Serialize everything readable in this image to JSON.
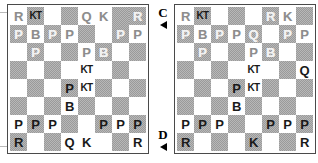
{
  "page": {
    "background_color": "#ffffff"
  },
  "colors": {
    "light_square": "#ffffff",
    "dark_square": "#9a9a9a",
    "board_border": "#4a4a4a",
    "black_piece": "#1a1a1a",
    "white_piece": "#e8e8e8",
    "marker_text": "#000000"
  },
  "markers": [
    {
      "id": "marker-c",
      "label": "C",
      "arrow": "left-triangle-icon",
      "points_to": "diagram-right-top"
    },
    {
      "id": "marker-d",
      "label": "D",
      "arrow": "right-triangle-icon",
      "points_to": "diagram-right-bottom"
    }
  ],
  "piece_glyphs": {
    "R": "R",
    "KT": "KT",
    "B": "B",
    "Q": "Q",
    "K": "K",
    "P": "P"
  },
  "piece_names": {
    "R": "rook",
    "KT": "knight",
    "B": "bishop",
    "Q": "queen",
    "K": "king",
    "P": "pawn"
  },
  "diagrams": [
    {
      "id": "diagram-left",
      "name": "chess-board-left",
      "label": "",
      "files": [
        "a",
        "b",
        "c",
        "d",
        "e",
        "f",
        "g",
        "h"
      ],
      "ranks": [
        8,
        7,
        6,
        5,
        4,
        3,
        2,
        1
      ],
      "rows": [
        [
          {
            "piece": "R",
            "color": "white",
            "square": "light"
          },
          {
            "piece": "KT",
            "color": "black",
            "square": "dark"
          },
          {
            "piece": "",
            "color": "",
            "square": "light"
          },
          {
            "piece": "",
            "color": "",
            "square": "dark"
          },
          {
            "piece": "Q",
            "color": "white",
            "square": "light"
          },
          {
            "piece": "K",
            "color": "white",
            "square": "light"
          },
          {
            "piece": "",
            "color": "",
            "square": "dark"
          },
          {
            "piece": "R",
            "color": "white",
            "square": "dark"
          }
        ],
        [
          {
            "piece": "P",
            "color": "white",
            "square": "dark"
          },
          {
            "piece": "B",
            "color": "white",
            "square": "light"
          },
          {
            "piece": "P",
            "color": "white",
            "square": "dark"
          },
          {
            "piece": "P",
            "color": "white",
            "square": "light"
          },
          {
            "piece": "",
            "color": "",
            "square": "dark"
          },
          {
            "piece": "",
            "color": "",
            "square": "light"
          },
          {
            "piece": "P",
            "color": "white",
            "square": "dark"
          },
          {
            "piece": "P",
            "color": "white",
            "square": "light"
          }
        ],
        [
          {
            "piece": "",
            "color": "",
            "square": "light"
          },
          {
            "piece": "P",
            "color": "white",
            "square": "dark"
          },
          {
            "piece": "",
            "color": "",
            "square": "light"
          },
          {
            "piece": "",
            "color": "",
            "square": "dark"
          },
          {
            "piece": "P",
            "color": "white",
            "square": "light"
          },
          {
            "piece": "B",
            "color": "white",
            "square": "dark"
          },
          {
            "piece": "",
            "color": "",
            "square": "light"
          },
          {
            "piece": "",
            "color": "",
            "square": "dark"
          }
        ],
        [
          {
            "piece": "",
            "color": "",
            "square": "dark"
          },
          {
            "piece": "",
            "color": "",
            "square": "light"
          },
          {
            "piece": "",
            "color": "",
            "square": "dark"
          },
          {
            "piece": "",
            "color": "",
            "square": "light"
          },
          {
            "piece": "KT",
            "color": "black",
            "square": "light"
          },
          {
            "piece": "",
            "color": "",
            "square": "light"
          },
          {
            "piece": "",
            "color": "",
            "square": "dark"
          },
          {
            "piece": "",
            "color": "",
            "square": "light"
          }
        ],
        [
          {
            "piece": "",
            "color": "",
            "square": "light"
          },
          {
            "piece": "",
            "color": "",
            "square": "dark"
          },
          {
            "piece": "",
            "color": "",
            "square": "light"
          },
          {
            "piece": "P",
            "color": "black",
            "square": "dark"
          },
          {
            "piece": "KT",
            "color": "black",
            "square": "light"
          },
          {
            "piece": "",
            "color": "",
            "square": "dark"
          },
          {
            "piece": "",
            "color": "",
            "square": "light"
          },
          {
            "piece": "",
            "color": "",
            "square": "dark"
          }
        ],
        [
          {
            "piece": "",
            "color": "",
            "square": "dark"
          },
          {
            "piece": "",
            "color": "",
            "square": "light"
          },
          {
            "piece": "",
            "color": "",
            "square": "dark"
          },
          {
            "piece": "B",
            "color": "black",
            "square": "light"
          },
          {
            "piece": "",
            "color": "",
            "square": "dark"
          },
          {
            "piece": "",
            "color": "",
            "square": "light"
          },
          {
            "piece": "",
            "color": "",
            "square": "dark"
          },
          {
            "piece": "",
            "color": "",
            "square": "light"
          }
        ],
        [
          {
            "piece": "P",
            "color": "black",
            "square": "light"
          },
          {
            "piece": "P",
            "color": "black",
            "square": "dark"
          },
          {
            "piece": "P",
            "color": "black",
            "square": "light"
          },
          {
            "piece": "",
            "color": "",
            "square": "dark"
          },
          {
            "piece": "",
            "color": "",
            "square": "light"
          },
          {
            "piece": "P",
            "color": "black",
            "square": "dark"
          },
          {
            "piece": "P",
            "color": "black",
            "square": "light"
          },
          {
            "piece": "P",
            "color": "black",
            "square": "dark"
          }
        ],
        [
          {
            "piece": "R",
            "color": "black",
            "square": "dark"
          },
          {
            "piece": "",
            "color": "",
            "square": "light"
          },
          {
            "piece": "",
            "color": "",
            "square": "dark"
          },
          {
            "piece": "Q",
            "color": "black",
            "square": "light"
          },
          {
            "piece": "K",
            "color": "black",
            "square": "light"
          },
          {
            "piece": "",
            "color": "",
            "square": "light"
          },
          {
            "piece": "",
            "color": "",
            "square": "dark"
          },
          {
            "piece": "R",
            "color": "black",
            "square": "light"
          }
        ]
      ]
    },
    {
      "id": "diagram-right",
      "name": "chess-board-right",
      "label": "",
      "files": [
        "a",
        "b",
        "c",
        "d",
        "e",
        "f",
        "g",
        "h"
      ],
      "ranks": [
        8,
        7,
        6,
        5,
        4,
        3,
        2,
        1
      ],
      "rows": [
        [
          {
            "piece": "R",
            "color": "white",
            "square": "light"
          },
          {
            "piece": "KT",
            "color": "black",
            "square": "dark"
          },
          {
            "piece": "",
            "color": "",
            "square": "light"
          },
          {
            "piece": "",
            "color": "",
            "square": "dark"
          },
          {
            "piece": "",
            "color": "",
            "square": "light"
          },
          {
            "piece": "R",
            "color": "white",
            "square": "dark"
          },
          {
            "piece": "K",
            "color": "white",
            "square": "light"
          },
          {
            "piece": "",
            "color": "",
            "square": "dark"
          }
        ],
        [
          {
            "piece": "P",
            "color": "white",
            "square": "dark"
          },
          {
            "piece": "B",
            "color": "white",
            "square": "light"
          },
          {
            "piece": "P",
            "color": "white",
            "square": "dark"
          },
          {
            "piece": "P",
            "color": "white",
            "square": "light"
          },
          {
            "piece": "Q",
            "color": "white",
            "square": "dark"
          },
          {
            "piece": "",
            "color": "",
            "square": "light"
          },
          {
            "piece": "P",
            "color": "white",
            "square": "dark"
          },
          {
            "piece": "P",
            "color": "white",
            "square": "light"
          }
        ],
        [
          {
            "piece": "",
            "color": "",
            "square": "light"
          },
          {
            "piece": "P",
            "color": "white",
            "square": "dark"
          },
          {
            "piece": "",
            "color": "",
            "square": "light"
          },
          {
            "piece": "",
            "color": "",
            "square": "dark"
          },
          {
            "piece": "P",
            "color": "white",
            "square": "light"
          },
          {
            "piece": "B",
            "color": "white",
            "square": "dark"
          },
          {
            "piece": "",
            "color": "",
            "square": "light"
          },
          {
            "piece": "",
            "color": "",
            "square": "dark"
          }
        ],
        [
          {
            "piece": "",
            "color": "",
            "square": "dark"
          },
          {
            "piece": "",
            "color": "",
            "square": "light"
          },
          {
            "piece": "",
            "color": "",
            "square": "dark"
          },
          {
            "piece": "",
            "color": "",
            "square": "light"
          },
          {
            "piece": "KT",
            "color": "black",
            "square": "light"
          },
          {
            "piece": "",
            "color": "",
            "square": "light"
          },
          {
            "piece": "",
            "color": "",
            "square": "dark"
          },
          {
            "piece": "Q",
            "color": "black",
            "square": "light"
          }
        ],
        [
          {
            "piece": "",
            "color": "",
            "square": "light"
          },
          {
            "piece": "",
            "color": "",
            "square": "dark"
          },
          {
            "piece": "",
            "color": "",
            "square": "light"
          },
          {
            "piece": "P",
            "color": "black",
            "square": "dark"
          },
          {
            "piece": "KT",
            "color": "black",
            "square": "light"
          },
          {
            "piece": "",
            "color": "",
            "square": "dark"
          },
          {
            "piece": "",
            "color": "",
            "square": "light"
          },
          {
            "piece": "",
            "color": "",
            "square": "dark"
          }
        ],
        [
          {
            "piece": "",
            "color": "",
            "square": "dark"
          },
          {
            "piece": "",
            "color": "",
            "square": "light"
          },
          {
            "piece": "",
            "color": "",
            "square": "dark"
          },
          {
            "piece": "B",
            "color": "black",
            "square": "light"
          },
          {
            "piece": "",
            "color": "",
            "square": "dark"
          },
          {
            "piece": "",
            "color": "",
            "square": "light"
          },
          {
            "piece": "",
            "color": "",
            "square": "dark"
          },
          {
            "piece": "",
            "color": "",
            "square": "light"
          }
        ],
        [
          {
            "piece": "P",
            "color": "black",
            "square": "light"
          },
          {
            "piece": "P",
            "color": "black",
            "square": "dark"
          },
          {
            "piece": "P",
            "color": "black",
            "square": "light"
          },
          {
            "piece": "",
            "color": "",
            "square": "dark"
          },
          {
            "piece": "",
            "color": "",
            "square": "light"
          },
          {
            "piece": "P",
            "color": "black",
            "square": "dark"
          },
          {
            "piece": "P",
            "color": "black",
            "square": "light"
          },
          {
            "piece": "P",
            "color": "black",
            "square": "dark"
          }
        ],
        [
          {
            "piece": "R",
            "color": "black",
            "square": "dark"
          },
          {
            "piece": "",
            "color": "",
            "square": "light"
          },
          {
            "piece": "",
            "color": "",
            "square": "dark"
          },
          {
            "piece": "",
            "color": "",
            "square": "light"
          },
          {
            "piece": "K",
            "color": "black",
            "square": "dark"
          },
          {
            "piece": "",
            "color": "",
            "square": "light"
          },
          {
            "piece": "",
            "color": "",
            "square": "dark"
          },
          {
            "piece": "R",
            "color": "black",
            "square": "light"
          }
        ]
      ]
    }
  ]
}
